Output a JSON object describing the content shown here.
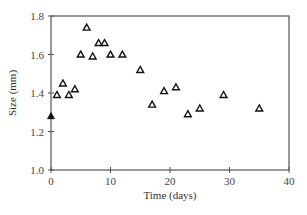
{
  "chart_data": {
    "type": "scatter",
    "title": "",
    "xlabel": "Time (days)",
    "ylabel": "Size (mm)",
    "xlim": [
      0,
      40
    ],
    "ylim": [
      1.0,
      1.8
    ],
    "xticks": [
      0,
      10,
      20,
      30,
      40
    ],
    "yticks": [
      1.0,
      1.2,
      1.4,
      1.6,
      1.8
    ],
    "xtick_labels": [
      "0",
      "10",
      "20",
      "30",
      "40"
    ],
    "ytick_labels": [
      "1.0",
      "1.2",
      "1.4",
      "1.6",
      "1.8"
    ],
    "grid": false,
    "legend": null,
    "series": [
      {
        "name": "initial",
        "marker": "filled-triangle",
        "color": "#111111",
        "points": [
          {
            "x": 0,
            "y": 1.28
          }
        ]
      },
      {
        "name": "measurements",
        "marker": "open-triangle",
        "color": "#111111",
        "points": [
          {
            "x": 1,
            "y": 1.39
          },
          {
            "x": 2,
            "y": 1.45
          },
          {
            "x": 3,
            "y": 1.39
          },
          {
            "x": 4,
            "y": 1.42
          },
          {
            "x": 5,
            "y": 1.6
          },
          {
            "x": 6,
            "y": 1.74
          },
          {
            "x": 7,
            "y": 1.59
          },
          {
            "x": 8,
            "y": 1.66
          },
          {
            "x": 9,
            "y": 1.66
          },
          {
            "x": 10,
            "y": 1.6
          },
          {
            "x": 12,
            "y": 1.6
          },
          {
            "x": 15,
            "y": 1.52
          },
          {
            "x": 17,
            "y": 1.34
          },
          {
            "x": 19,
            "y": 1.41
          },
          {
            "x": 21,
            "y": 1.43
          },
          {
            "x": 23,
            "y": 1.29
          },
          {
            "x": 25,
            "y": 1.32
          },
          {
            "x": 29,
            "y": 1.39
          },
          {
            "x": 35,
            "y": 1.32
          }
        ]
      }
    ]
  }
}
